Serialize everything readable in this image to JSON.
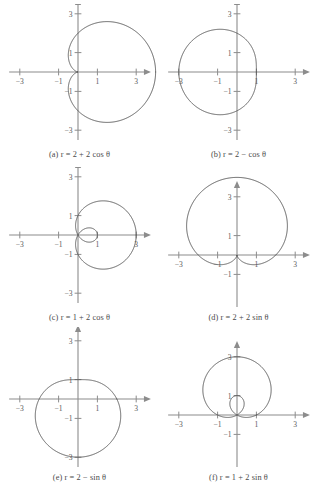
{
  "figure": {
    "kind": "polar-graph-grid",
    "rows": 3,
    "cols": 2,
    "axis_color": "#8c8c8c",
    "curve_color": "#555555",
    "tick_label_color": "#5a5a5a",
    "background": "#ffffff"
  },
  "chart_data": [
    {
      "id": "a",
      "type": "line",
      "coordinate_system": "polar",
      "title": "(a) r = 2 + 2 cos θ",
      "equation": "r = 2 + 2 cos θ",
      "curve_name": "cardioid",
      "a": 2,
      "b": 2,
      "trig": "cos",
      "xlabel": "",
      "ylabel": "",
      "xlim": [
        -3.6,
        3.6
      ],
      "ylim": [
        -3.6,
        3.6
      ],
      "xticks": [
        -3,
        -1,
        1,
        3
      ],
      "yticks": [
        -3,
        -1,
        1,
        3
      ],
      "xtick_labels": [
        "-3",
        "-1",
        "1",
        "3"
      ],
      "ytick_labels": [
        "-3",
        "-1",
        "1",
        "3"
      ],
      "grid": false,
      "legend": "none",
      "r_max": 4,
      "r_min": 0,
      "extent_x": [
        -0.5,
        4.0
      ],
      "extent_y": [
        -2.6,
        2.6
      ]
    },
    {
      "id": "b",
      "type": "line",
      "coordinate_system": "polar",
      "title": "(b) r = 2 − cos θ",
      "equation": "r = 2 − cos θ",
      "curve_name": "limacon (convex)",
      "a": 2,
      "b": -1,
      "trig": "cos",
      "xlabel": "",
      "ylabel": "",
      "xlim": [
        -3.6,
        3.6
      ],
      "ylim": [
        -3.6,
        3.6
      ],
      "xticks": [
        -3,
        -1,
        1,
        3
      ],
      "yticks": [
        -3,
        -1,
        1,
        3
      ],
      "xtick_labels": [
        "-3",
        "-1",
        "1",
        "3"
      ],
      "ytick_labels": [
        "-3",
        "-1",
        "1",
        "3"
      ],
      "grid": false,
      "legend": "none",
      "r_max": 3,
      "r_min": 1,
      "extent_x": [
        -3.0,
        1.0
      ],
      "extent_y": [
        -2.1,
        2.1
      ]
    },
    {
      "id": "c",
      "type": "line",
      "coordinate_system": "polar",
      "title": "(c) r = 1 + 2 cos θ",
      "equation": "r = 1 + 2 cos θ",
      "curve_name": "limacon with inner loop",
      "a": 1,
      "b": 2,
      "trig": "cos",
      "xlabel": "",
      "ylabel": "",
      "xlim": [
        -3.6,
        3.6
      ],
      "ylim": [
        -3.6,
        3.6
      ],
      "xticks": [
        -3,
        -1,
        1,
        3
      ],
      "yticks": [
        -3,
        -1,
        1,
        3
      ],
      "xtick_labels": [
        "-3",
        "-1",
        "1",
        "3"
      ],
      "ytick_labels": [
        "-3",
        "-1",
        "1",
        "3"
      ],
      "grid": false,
      "legend": "none",
      "r_max": 3,
      "r_min": -1,
      "extent_x": [
        -1.0,
        3.0
      ],
      "extent_y": [
        -1.8,
        1.8
      ]
    },
    {
      "id": "d",
      "type": "line",
      "coordinate_system": "polar",
      "title": "(d) r = 2 + 2 sin θ",
      "equation": "r = 2 + 2 sin θ",
      "curve_name": "cardioid",
      "a": 2,
      "b": 2,
      "trig": "sin",
      "xlabel": "",
      "ylabel": "",
      "xlim": [
        -3.6,
        3.6
      ],
      "ylim": [
        -3.6,
        3.6
      ],
      "xticks": [
        -3,
        -1,
        1,
        3
      ],
      "yticks": [
        -3,
        -1,
        1,
        3
      ],
      "xtick_labels": [
        "-3",
        "-1",
        "1",
        "3"
      ],
      "ytick_labels": [
        "-3",
        "-1",
        "1",
        "3"
      ],
      "grid": false,
      "legend": "none",
      "r_max": 4,
      "r_min": 0,
      "extent_x": [
        -2.6,
        2.6
      ],
      "extent_y": [
        -0.5,
        4.0
      ]
    },
    {
      "id": "e",
      "type": "line",
      "coordinate_system": "polar",
      "title": "(e) r = 2 − sin θ",
      "equation": "r = 2 − sin θ",
      "curve_name": "limacon (convex)",
      "a": 2,
      "b": -1,
      "trig": "sin",
      "xlabel": "",
      "ylabel": "",
      "xlim": [
        -3.6,
        3.6
      ],
      "ylim": [
        -3.6,
        3.6
      ],
      "xticks": [
        -3,
        -1,
        1,
        3
      ],
      "yticks": [
        -3,
        -1,
        1,
        3
      ],
      "xtick_labels": [
        "-3",
        "-1",
        "1",
        "3"
      ],
      "ytick_labels": [
        "-3",
        "-1",
        "1",
        "3"
      ],
      "grid": false,
      "legend": "none",
      "r_max": 3,
      "r_min": 1,
      "extent_x": [
        -2.1,
        2.1
      ],
      "extent_y": [
        -3.0,
        1.0
      ]
    },
    {
      "id": "f",
      "type": "line",
      "coordinate_system": "polar",
      "title": "(f) r = 1 + 2 sin θ",
      "equation": "r = 1 + 2 sin θ",
      "curve_name": "limacon with inner loop",
      "a": 1,
      "b": 2,
      "trig": "sin",
      "xlabel": "",
      "ylabel": "",
      "xlim": [
        -3.6,
        3.6
      ],
      "ylim": [
        -3.6,
        3.6
      ],
      "xticks": [
        -3,
        -1,
        1,
        3
      ],
      "yticks": [
        -3,
        -1,
        1,
        3
      ],
      "xtick_labels": [
        "-3",
        "-1",
        "1",
        "3"
      ],
      "ytick_labels": [
        "-3",
        "-1",
        "1",
        "3"
      ],
      "grid": false,
      "legend": "none",
      "r_max": 3,
      "r_min": -1,
      "extent_x": [
        -1.8,
        1.8
      ],
      "extent_y": [
        -1.0,
        3.0
      ]
    }
  ],
  "panels": {
    "a": {
      "caption_label": "(a)",
      "caption_var": "r",
      "caption_eq": "= 2 + 2 cos θ",
      "caption_full": "(a) r = 2 + 2 cos θ"
    },
    "b": {
      "caption_label": "(b)",
      "caption_var": "r",
      "caption_eq": "= 2 − cos θ",
      "caption_full": "(b) r = 2 − cos θ"
    },
    "c": {
      "caption_label": "(c)",
      "caption_var": "r",
      "caption_eq": "= 1 + 2 cos θ",
      "caption_full": "(c) r = 1 + 2 cos θ"
    },
    "d": {
      "caption_label": "(d)",
      "caption_var": "r",
      "caption_eq": "= 2 + 2 sin θ",
      "caption_full": "(d) r = 2 + 2 sin θ"
    },
    "e": {
      "caption_label": "(e)",
      "caption_var": "r",
      "caption_eq": "= 2 − sin θ",
      "caption_full": "(e) r = 2 − sin θ"
    },
    "f": {
      "caption_label": "(f)",
      "caption_var": "r",
      "caption_eq": "= 1 + 2 sin θ",
      "caption_full": "(f) r = 1 + 2 sin θ"
    }
  }
}
